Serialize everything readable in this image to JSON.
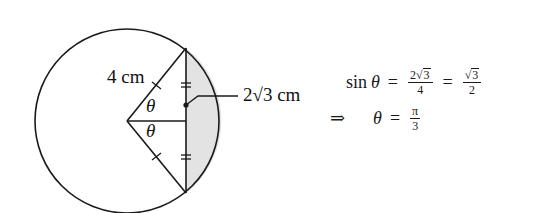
{
  "figure": {
    "radius_label": "4 cm",
    "angle_label_top": "θ",
    "angle_label_bottom": "θ",
    "half_chord_label": "2√3 cm",
    "shaded_color": "#e3e3e3",
    "stroke_color": "#1a1a1a"
  },
  "equations": {
    "line1": {
      "lhs_func": "sin",
      "lhs_var": "θ",
      "eq1": "=",
      "frac1_num_coef": "2",
      "frac1_num_rad": "3",
      "frac1_den": "4",
      "eq2": "=",
      "frac2_num_rad": "3",
      "frac2_den": "2"
    },
    "line2": {
      "implies": "⇒",
      "var": "θ",
      "eq": "=",
      "frac_num": "π",
      "frac_den": "3"
    }
  }
}
